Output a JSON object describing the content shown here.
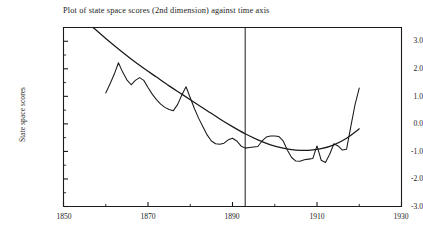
{
  "chart_data": {
    "type": "line",
    "title": "Plot of state space scores (2nd dimension) against time axis",
    "xlabel": "",
    "ylabel": "State space scores",
    "xlim": [
      1850,
      1930
    ],
    "ylim": [
      -3.0,
      3.5
    ],
    "grid": false,
    "legend": null,
    "xticks": [
      1850,
      1870,
      1890,
      1910,
      1930
    ],
    "xtick_labels": [
      "1850",
      "1870",
      "1890",
      "1910",
      "1930"
    ],
    "xminor_ticks": [
      1860,
      1880,
      1900,
      1920
    ],
    "yticks": [
      3.0,
      2.0,
      1.0,
      0.0,
      -1.0,
      -2.0,
      -3.0
    ],
    "ytick_labels": [
      "3.0",
      "2.0",
      "1.0",
      "0.0",
      "-1.0",
      "-2.0",
      "-3.0"
    ],
    "yminor_ticks": [
      2.5,
      1.5,
      0.5,
      -0.5,
      -1.5,
      -2.5
    ],
    "annotations": [
      {
        "name": "vertical-reference-line",
        "type": "vline",
        "x": 1893
      }
    ],
    "series": [
      {
        "name": "smooth-fitted-curve",
        "style": "solid",
        "color": "#1a1a1a",
        "x": [
          1857,
          1860,
          1863,
          1866,
          1869,
          1872,
          1875,
          1878,
          1881,
          1884,
          1887,
          1890,
          1893,
          1896,
          1899,
          1902,
          1905,
          1908,
          1911,
          1914,
          1917,
          1920
        ],
        "y": [
          3.5,
          3.1,
          2.72,
          2.36,
          2.02,
          1.7,
          1.38,
          1.08,
          0.78,
          0.48,
          0.18,
          -0.1,
          -0.36,
          -0.58,
          -0.76,
          -0.88,
          -0.95,
          -0.96,
          -0.9,
          -0.76,
          -0.52,
          -0.18
        ]
      },
      {
        "name": "state-space-scores-observed",
        "style": "solid",
        "color": "#1a1a1a",
        "x": [
          1860,
          1861,
          1862,
          1863,
          1864,
          1865,
          1866,
          1867,
          1868,
          1869,
          1870,
          1871,
          1872,
          1873,
          1874,
          1875,
          1876,
          1877,
          1878,
          1879,
          1880,
          1881,
          1882,
          1883,
          1884,
          1885,
          1886,
          1887,
          1888,
          1889,
          1890,
          1891,
          1892,
          1893,
          1894,
          1895,
          1896,
          1897,
          1898,
          1899,
          1900,
          1901,
          1902,
          1903,
          1904,
          1905,
          1906,
          1907,
          1908,
          1909,
          1910,
          1911,
          1912,
          1913,
          1914,
          1915,
          1916,
          1917,
          1918,
          1919,
          1920
        ],
        "y": [
          1.12,
          1.45,
          1.8,
          2.22,
          1.88,
          1.6,
          1.42,
          1.58,
          1.68,
          1.58,
          1.32,
          1.08,
          0.88,
          0.72,
          0.6,
          0.52,
          0.48,
          0.7,
          1.05,
          1.35,
          0.95,
          0.55,
          0.2,
          -0.1,
          -0.4,
          -0.62,
          -0.72,
          -0.74,
          -0.7,
          -0.58,
          -0.52,
          -0.62,
          -0.8,
          -0.88,
          -0.86,
          -0.84,
          -0.82,
          -0.62,
          -0.48,
          -0.44,
          -0.44,
          -0.46,
          -0.62,
          -0.96,
          -1.22,
          -1.35,
          -1.36,
          -1.3,
          -1.28,
          -1.26,
          -0.8,
          -1.32,
          -1.4,
          -1.1,
          -0.72,
          -0.8,
          -0.95,
          -0.92,
          -0.1,
          0.7,
          1.3
        ]
      }
    ]
  },
  "axes": {
    "frame_color": "#1a1a1a"
  }
}
